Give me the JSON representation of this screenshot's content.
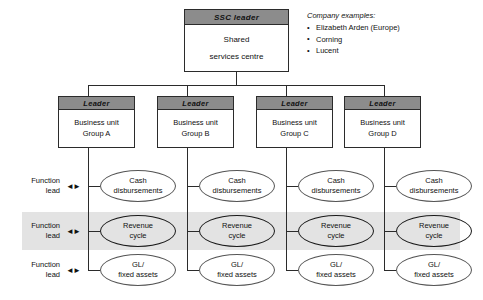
{
  "root": {
    "header": "SSC  leader",
    "line1": "Shared",
    "line2": "services centre"
  },
  "examples": {
    "title": "Company examples:",
    "items": [
      "Elizabeth Arden (Europe)",
      "Corning",
      "Lucent"
    ]
  },
  "business_units": [
    {
      "header": "Leader",
      "line1": "Business unit",
      "line2": "Group A"
    },
    {
      "header": "Leader",
      "line1": "Business unit",
      "line2": "Group B"
    },
    {
      "header": "Leader",
      "line1": "Business unit",
      "line2": "Group C"
    },
    {
      "header": "Leader",
      "line1": "Business unit",
      "line2": "Group D"
    }
  ],
  "function_rows": [
    {
      "label_line1": "Function",
      "label_line2": "lead",
      "arrow": "◄►",
      "process_line1": "Cash",
      "process_line2": "disbursements",
      "highlighted": false
    },
    {
      "label_line1": "Function",
      "label_line2": "lead",
      "arrow": "◄►",
      "process_line1": "Revenue",
      "process_line2": "cycle",
      "highlighted": true
    },
    {
      "label_line1": "Function",
      "label_line2": "lead",
      "arrow": "◄►",
      "process_line1": "GL/",
      "process_line2": "fixed assets",
      "highlighted": false
    }
  ],
  "colors": {
    "header_fill": "#8c8c8c",
    "band_fill": "#e3e3e3",
    "line": "#2b2b2b",
    "background": "#ffffff"
  }
}
